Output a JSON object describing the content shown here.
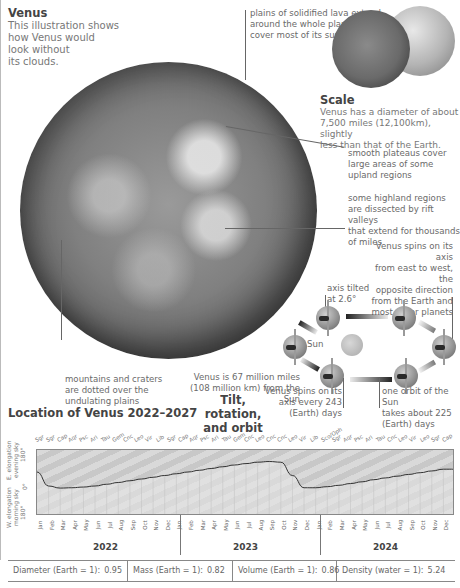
{
  "venus_intro": {
    "title": "Venus",
    "body": [
      "This illustration shows",
      "how Venus would",
      "look without",
      "its clouds."
    ]
  },
  "annotations": {
    "lava_plains": [
      "plains of solidified lava extend",
      "around the whole planet and",
      "cover most of its surface"
    ],
    "plateaus": [
      "smooth plateaus cover",
      "large areas of some",
      "upland regions"
    ],
    "highlands": [
      "some highland regions",
      "are dissected by rift valleys",
      "that extend for thousands",
      "of miles"
    ],
    "mountains": [
      "mountains and craters",
      "are dotted over the",
      "undulating plains"
    ]
  },
  "scale": {
    "title": "Scale",
    "body": [
      "Venus has a diameter of about",
      "7,500 miles (12,100km), slightly",
      "less than that of the Earth."
    ]
  },
  "orbit": {
    "title": [
      "Tilt, rotation,",
      "and orbit"
    ],
    "spin_direction": [
      "Venus spins on its axis",
      "from east to west, the",
      "opposite direction",
      "from the Earth and",
      "most other planets"
    ],
    "axis_tilt": [
      "axis tilted",
      "at 2.6°"
    ],
    "sun_label": "Sun",
    "distance": [
      "Venus is 67 million miles",
      "(108 million km) from the Sun"
    ],
    "rotation": [
      "Venus spins on its",
      "axis every 243",
      "(Earth) days"
    ],
    "orbit_period": [
      "one orbit of the Sun",
      "takes about 225",
      "(Earth) days"
    ]
  },
  "chart_data": {
    "type": "line",
    "title": "Location of Venus 2022–2027",
    "ylabel_top": [
      "E. elongation",
      "evening sky",
      "180°"
    ],
    "ylabel_mid": "0°",
    "ylabel_bottom": [
      "W. elongation",
      "morning sky",
      "180°"
    ],
    "years": [
      "2022",
      "2023",
      "2024"
    ],
    "months": [
      "Jan",
      "Feb",
      "Mar",
      "Apr",
      "May",
      "Jun",
      "Jul",
      "Aug",
      "Sep",
      "Oct",
      "Nov",
      "Dec",
      "Jan",
      "Feb",
      "Mar",
      "Apr",
      "May",
      "Jun",
      "Jul",
      "Aug",
      "Sep",
      "Oct",
      "Nov",
      "Dec",
      "Jan",
      "Feb",
      "Mar",
      "Apr",
      "May",
      "Jun",
      "Jul",
      "Aug",
      "Sep",
      "Oct",
      "Nov",
      "Dec"
    ],
    "constellations": [
      "Sgr",
      "Sgr",
      "Cap",
      "Aqr",
      "Psc",
      "Ari",
      "Tau",
      "Gem",
      "Cnc",
      "Leo",
      "Vir",
      "Lib",
      "Sgr",
      "Cap",
      "Aqr",
      "Psc",
      "Ari",
      "Tau",
      "Gem",
      "Cnc",
      "Leo",
      "Cnc",
      "Cnc",
      "Leo",
      "Vir",
      "Lib",
      "Sco/Oph",
      "Sgr",
      "Aqr",
      "Psc",
      "Ari",
      "Tau",
      "Cnc",
      "Leo",
      "Vir",
      "Leo",
      "Sgr",
      "Cap"
    ],
    "elongation_deg": [
      0,
      -40,
      -46,
      -45,
      -43,
      -40,
      -35,
      -30,
      -25,
      -20,
      -15,
      -10,
      -5,
      0,
      5,
      10,
      15,
      20,
      24,
      28,
      30,
      28,
      -10,
      -45,
      -45,
      -42,
      -38,
      -33,
      -28,
      -22,
      -17,
      -12,
      -7,
      -2,
      3,
      8
    ],
    "ylim": [
      -180,
      180
    ]
  },
  "stats": [
    {
      "label": "Diameter (Earth = 1):",
      "value": "0.95"
    },
    {
      "label": "Mass (Earth = 1):",
      "value": "0.82"
    },
    {
      "label": "Volume (Earth = 1):",
      "value": "0.86"
    },
    {
      "label": "Density (water = 1):",
      "value": "5.24"
    }
  ]
}
